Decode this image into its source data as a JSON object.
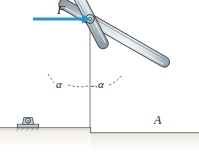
{
  "figure": {
    "name": "two-bar-frame-statics-diagram",
    "background_color": "#ffffff"
  },
  "labels": {
    "force": "F",
    "point_a": "A",
    "angle_left": "α",
    "angle_right": "α"
  },
  "force_arrow": {
    "label": "F",
    "color": "#2196d8",
    "direction": "right",
    "start_x": 33,
    "start_y": 19,
    "end_x": 88,
    "end_y": 19,
    "shaft_thickness": 3
  },
  "geometry": {
    "top_pin": {
      "x": 90,
      "y": 19,
      "radius": 4.2
    },
    "left_base_pin": {
      "x": 28,
      "y": 127,
      "radius": 3.2
    },
    "point_a": {
      "x": 147,
      "y": 128
    },
    "left_bar": {
      "from_x": 90,
      "from_y": 19,
      "to_x": 28,
      "to_y": 127,
      "half_width": 5.0
    },
    "right_bar": {
      "from_x": 90,
      "from_y": 19,
      "to_x": 147,
      "to_y": 128,
      "half_width": 5.0
    },
    "centerline": {
      "x": 90,
      "from_y": 22,
      "to_y": 128
    }
  },
  "ground": {
    "upper_step_top_y": 128,
    "upper_step_right_x": 91,
    "lower_ground_top_y": 133,
    "bottom_y": 152,
    "fill_color": "#e9e8e1",
    "edge_color": "#8d8d86",
    "face_color": "#f3f2ec"
  },
  "bar_style": {
    "outline_color": "#43464a",
    "light_color": "#eef2f3",
    "mid_color": "#c3cfd4",
    "dark_color": "#9aa9b0",
    "shadow_color": "#7d8c93"
  },
  "angles": {
    "left_arc_label": "α",
    "right_arc_label": "α",
    "dash_color": "#3a3a3a"
  }
}
